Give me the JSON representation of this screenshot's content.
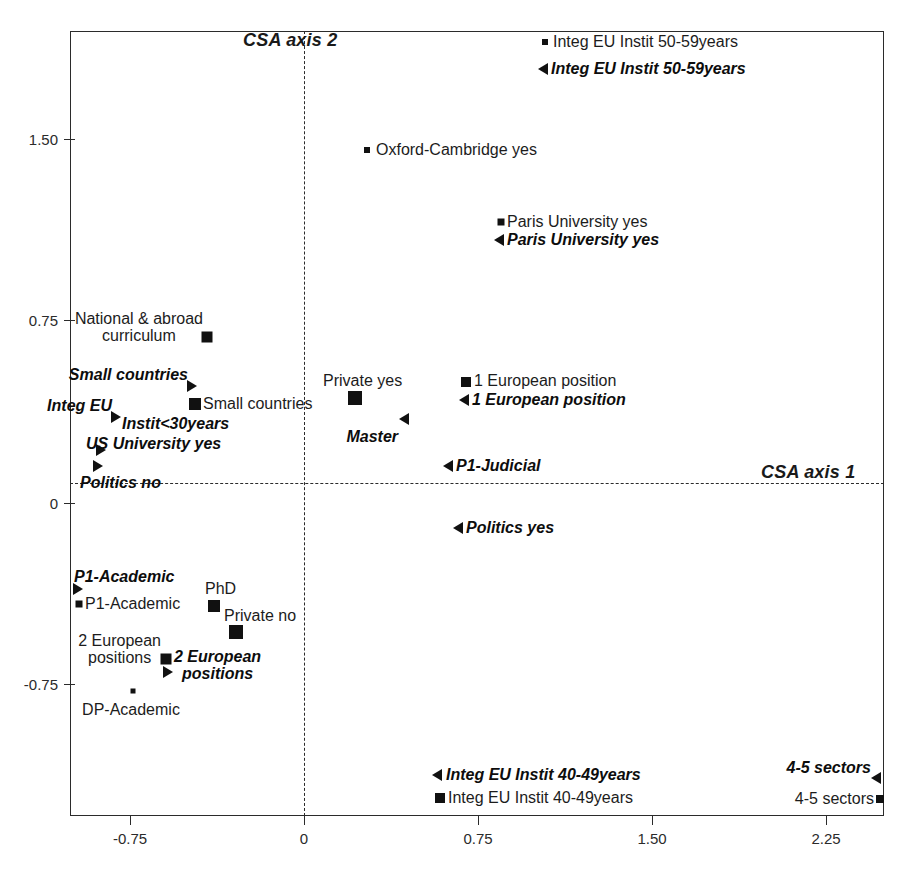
{
  "chart_data": {
    "type": "scatter",
    "title": "",
    "xlabel": "CSA axis 1",
    "ylabel": "CSA axis 2",
    "xlim": [
      -1.06,
      2.5
    ],
    "ylim": [
      -1.12,
      1.95
    ],
    "xticks": [
      "-0.75",
      "0",
      "0.75",
      "1.50",
      "2.25"
    ],
    "xtick_values": [
      -0.75,
      0,
      0.75,
      1.5,
      2.25
    ],
    "yticks": [
      "1.50",
      "0.75",
      "0",
      "-0.75"
    ],
    "ytick_values": [
      1.5,
      0.75,
      0,
      -0.75
    ],
    "grid": false,
    "legend": "none",
    "zero_lines": true,
    "marker_color": "#111111",
    "series": [
      {
        "name": "passive (square marker)",
        "marker": "square",
        "style": "regular",
        "points": [
          {
            "label": "Integ EU Instit 50-59years",
            "x": 1.04,
            "y": 1.8
          },
          {
            "label": "Oxford-Cambridge yes",
            "x": 0.27,
            "y": 1.44
          },
          {
            "label": "Paris University yes",
            "x": 0.85,
            "y": 1.13
          },
          {
            "label": "National & abroad\ncurriculum",
            "x": -0.42,
            "y": 0.66
          },
          {
            "label": "Small countries",
            "x": -0.34,
            "y": 0.41
          },
          {
            "label": "Private yes",
            "x": 0.35,
            "y": 0.4
          },
          {
            "label": "1 European position",
            "x": 0.72,
            "y": 0.43
          },
          {
            "label": "P1-Academic",
            "x": -0.89,
            "y": -0.49
          },
          {
            "label": "PhD",
            "x": -0.22,
            "y": -0.45
          },
          {
            "label": "Private no",
            "x": -0.13,
            "y": -0.54
          },
          {
            "label": "2 European\npositions",
            "x": -0.5,
            "y": -0.64
          },
          {
            "label": "DP-Academic",
            "x": -0.73,
            "y": -0.73
          },
          {
            "label": "Integ EU Instit 40-49years",
            "x": 0.66,
            "y": -1.05
          },
          {
            "label": "4-5 sectors",
            "x": 2.44,
            "y": -1.04
          }
        ]
      },
      {
        "name": "active (triangle marker)",
        "marker": "triangle",
        "style": "bold-italic",
        "points": [
          {
            "label": "Integ EU Instit 50-59years",
            "x": 1.03,
            "y": 1.69
          },
          {
            "label": "Paris University yes",
            "x": 0.84,
            "y": 1.05
          },
          {
            "label": "Small countries",
            "x": -0.38,
            "y": 0.48
          },
          {
            "label": "Integ EU",
            "x": -0.8,
            "y": 0.33
          },
          {
            "label": "Instit<30years",
            "x": -0.65,
            "y": 0.28
          },
          {
            "label": "US University yes",
            "x": -0.7,
            "y": 0.17
          },
          {
            "label": "Politics no",
            "x": -0.65,
            "y": 0.1
          },
          {
            "label": "1 European position",
            "x": 0.7,
            "y": 0.35
          },
          {
            "label": "Master",
            "x": 0.46,
            "y": 0.26
          },
          {
            "label": "P1-Judicial",
            "x": 0.63,
            "y": 0.13
          },
          {
            "label": "Politics yes",
            "x": 0.55,
            "y": -0.09
          },
          {
            "label": "P1-Academic",
            "x": -0.88,
            "y": -0.42
          },
          {
            "label": "2 European\npositions",
            "x": -0.49,
            "y": -0.68
          },
          {
            "label": "Integ EU Instit 40-49years",
            "x": 0.65,
            "y": -0.98
          },
          {
            "label": "4-5 sectors",
            "x": 2.47,
            "y": -0.99
          }
        ]
      }
    ]
  },
  "axes": {
    "axis1_label": "CSA axis 1",
    "axis2_label": "CSA axis 2",
    "xticks": [
      {
        "text": "-0.75",
        "px": 130
      },
      {
        "text": "0",
        "px": 304
      },
      {
        "text": "0.75",
        "px": 478
      },
      {
        "text": "1.50",
        "px": 652
      },
      {
        "text": "2.25",
        "px": 826
      }
    ],
    "yticks": [
      {
        "text": "1.50",
        "py": 139
      },
      {
        "text": "0.75",
        "py": 320
      },
      {
        "text": "0",
        "py": 503
      },
      {
        "text": "-0.75",
        "py": 684
      }
    ]
  },
  "markers": [
    {
      "id": "m-integeu5059-sq",
      "shape": "square",
      "size": 6,
      "x": 545,
      "y": 42
    },
    {
      "id": "m-integeu5059-tri",
      "shape": "tri-left",
      "x": 543,
      "y": 69
    },
    {
      "id": "m-oxford-sq",
      "shape": "square",
      "size": 6,
      "x": 367,
      "y": 150
    },
    {
      "id": "m-paris-sq",
      "shape": "square",
      "size": 7,
      "x": 501,
      "y": 222
    },
    {
      "id": "m-paris-tri",
      "shape": "tri-left",
      "x": 499,
      "y": 240
    },
    {
      "id": "m-national-sq",
      "shape": "square",
      "size": 11,
      "x": 207,
      "y": 337
    },
    {
      "id": "m-smallc-tri",
      "shape": "tri-right",
      "x": 192,
      "y": 386
    },
    {
      "id": "m-smallc-sq",
      "shape": "square",
      "size": 12,
      "x": 195,
      "y": 404
    },
    {
      "id": "m-privateyes-sq",
      "shape": "square",
      "size": 14,
      "x": 355,
      "y": 398
    },
    {
      "id": "m-1europos-sq",
      "shape": "square",
      "size": 10,
      "x": 466,
      "y": 382
    },
    {
      "id": "m-1europos-tri",
      "shape": "tri-left",
      "x": 464,
      "y": 400
    },
    {
      "id": "m-integeu-tri",
      "shape": "tri-right",
      "x": 116,
      "y": 417
    },
    {
      "id": "m-master-tri",
      "shape": "tri-left",
      "x": 404,
      "y": 419
    },
    {
      "id": "m-usuniv-tri",
      "shape": "tri-right",
      "x": 101,
      "y": 450
    },
    {
      "id": "m-politicsno-tri",
      "shape": "tri-right",
      "x": 98,
      "y": 466
    },
    {
      "id": "m-p1judicial-tri",
      "shape": "tri-left",
      "x": 448,
      "y": 466
    },
    {
      "id": "m-politicsyes-tri",
      "shape": "tri-left",
      "x": 458,
      "y": 528
    },
    {
      "id": "m-p1acad-tri",
      "shape": "tri-right",
      "x": 78,
      "y": 589
    },
    {
      "id": "m-p1acad-sq",
      "shape": "square",
      "size": 7,
      "x": 79,
      "y": 604
    },
    {
      "id": "m-phd-sq",
      "shape": "square",
      "size": 12,
      "x": 214,
      "y": 606
    },
    {
      "id": "m-privateno-sq",
      "shape": "square",
      "size": 14,
      "x": 236,
      "y": 632
    },
    {
      "id": "m-2europos-sq",
      "shape": "square",
      "size": 11,
      "x": 166,
      "y": 659
    },
    {
      "id": "m-2europos-tri",
      "shape": "tri-right",
      "x": 168,
      "y": 672
    },
    {
      "id": "m-dpacad-sq",
      "shape": "square",
      "size": 5,
      "x": 133,
      "y": 691
    },
    {
      "id": "m-integeu4049-tri",
      "shape": "tri-left",
      "x": 437,
      "y": 775
    },
    {
      "id": "m-integeu4049-sq",
      "shape": "square",
      "size": 10,
      "x": 440,
      "y": 798
    },
    {
      "id": "m-45sectors-tri",
      "shape": "tri-left",
      "x": 876,
      "y": 778
    },
    {
      "id": "m-45sectors-sq",
      "shape": "square",
      "size": 8,
      "x": 880,
      "y": 799
    }
  ],
  "labels": [
    {
      "id": "l-integeu5059-p",
      "text": "Integ EU Instit 50-59years",
      "x": 553,
      "y": 42,
      "anchor": "l",
      "active": false
    },
    {
      "id": "l-integeu5059-a",
      "text": "Integ EU Instit 50-59years",
      "x": 551,
      "y": 69,
      "anchor": "l",
      "active": true
    },
    {
      "id": "l-oxford-p",
      "text": "Oxford-Cambridge yes",
      "x": 376,
      "y": 150,
      "anchor": "l",
      "active": false
    },
    {
      "id": "l-paris-p",
      "text": "Paris University yes",
      "x": 507,
      "y": 222,
      "anchor": "l",
      "active": false
    },
    {
      "id": "l-paris-a",
      "text": "Paris University yes",
      "x": 507,
      "y": 240,
      "anchor": "l",
      "active": true
    },
    {
      "id": "l-national-p",
      "text": "National & abroad\ncurriculum",
      "x": 203,
      "y": 328,
      "anchor": "r",
      "align": "center",
      "active": false
    },
    {
      "id": "l-smallc-a",
      "text": "Small countries",
      "x": 188,
      "y": 375,
      "anchor": "r",
      "active": true
    },
    {
      "id": "l-smallc-p",
      "text": "Small countries",
      "x": 203,
      "y": 404,
      "anchor": "l",
      "active": false
    },
    {
      "id": "l-privateyes-p",
      "text": "Private yes",
      "x": 323,
      "y": 381,
      "anchor": "l",
      "active": false
    },
    {
      "id": "l-1europos-p",
      "text": "1 European position",
      "x": 474,
      "y": 381,
      "anchor": "l",
      "active": false
    },
    {
      "id": "l-1europos-a",
      "text": "1 European position",
      "x": 472,
      "y": 400,
      "anchor": "l",
      "active": true
    },
    {
      "id": "l-integeu-a",
      "text": "Integ EU",
      "x": 112,
      "y": 406,
      "anchor": "r",
      "active": true
    },
    {
      "id": "l-instit30-a",
      "text": "Instit<30years",
      "x": 122,
      "y": 424,
      "anchor": "l",
      "active": true
    },
    {
      "id": "l-master-a",
      "text": "Master",
      "x": 398,
      "y": 437,
      "anchor": "r",
      "active": true
    },
    {
      "id": "l-usuniv-a",
      "text": "US University yes",
      "x": 86,
      "y": 444,
      "anchor": "l",
      "active": true
    },
    {
      "id": "l-politicsno-a",
      "text": "Politics no",
      "x": 80,
      "y": 483,
      "anchor": "l",
      "active": true
    },
    {
      "id": "l-p1judicial-a",
      "text": "P1-Judicial",
      "x": 456,
      "y": 466,
      "anchor": "l",
      "active": true
    },
    {
      "id": "l-politicsyes-a",
      "text": "Politics yes",
      "x": 466,
      "y": 528,
      "anchor": "l",
      "active": true
    },
    {
      "id": "l-p1acad-a",
      "text": "P1-Academic",
      "x": 74,
      "y": 577,
      "anchor": "l",
      "active": true
    },
    {
      "id": "l-p1acad-p",
      "text": "P1-Academic",
      "x": 85,
      "y": 604,
      "anchor": "l",
      "active": false
    },
    {
      "id": "l-phd-p",
      "text": "PhD",
      "x": 205,
      "y": 589,
      "anchor": "l",
      "active": false
    },
    {
      "id": "l-privateno-p",
      "text": "Private no",
      "x": 224,
      "y": 616,
      "anchor": "l",
      "active": false
    },
    {
      "id": "l-2europos-p",
      "text": "2 European\npositions",
      "x": 161,
      "y": 650,
      "anchor": "r",
      "align": "center",
      "active": false
    },
    {
      "id": "l-2europos-a",
      "text": "2 European\npositions",
      "x": 174,
      "y": 666,
      "anchor": "l",
      "align": "center",
      "active": true
    },
    {
      "id": "l-dpacad-p",
      "text": "DP-Academic",
      "x": 131,
      "y": 710,
      "anchor": "c",
      "active": false
    },
    {
      "id": "l-integeu4049-a",
      "text": "Integ EU Instit 40-49years",
      "x": 446,
      "y": 775,
      "anchor": "l",
      "active": true
    },
    {
      "id": "l-integeu4049-p",
      "text": "Integ EU Instit 40-49years",
      "x": 448,
      "y": 798,
      "anchor": "l",
      "active": false
    },
    {
      "id": "l-45sectors-a",
      "text": "4-5 sectors",
      "x": 871,
      "y": 768,
      "anchor": "r",
      "active": true
    },
    {
      "id": "l-45sectors-p",
      "text": "4-5 sectors",
      "x": 874,
      "y": 799,
      "anchor": "r",
      "active": false
    }
  ]
}
